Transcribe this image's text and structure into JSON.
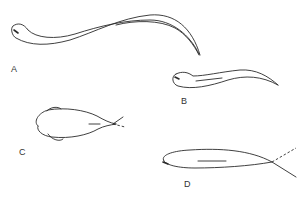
{
  "figure": {
    "panels": [
      {
        "id": "A",
        "label": "A",
        "description": "swimming eel-like fish body, long sinuous form with tail sweeping down to the right"
      },
      {
        "id": "B",
        "label": "B",
        "description": "smaller elongated fish in lateral view with short mid-body line"
      },
      {
        "id": "C",
        "label": "C",
        "description": "dorsal view of fish with pectoral fins and forked tail"
      },
      {
        "id": "D",
        "label": "D",
        "description": "streamlined lateral fish body with dashed tail extension"
      }
    ],
    "colors": {
      "line": "#2a2a2a",
      "background": "#ffffff",
      "label": "#333333"
    }
  }
}
